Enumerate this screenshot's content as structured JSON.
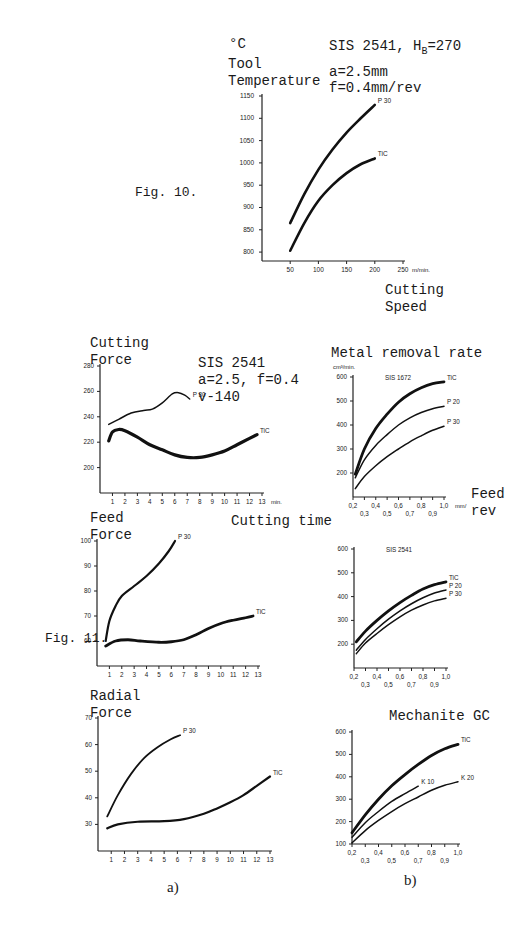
{
  "fig10": {
    "label": "Fig. 10.",
    "y_unit": "°C",
    "y_title_1": "Tool",
    "y_title_2": "Temperature",
    "cond_1": "SIS 2541, H",
    "cond_1_sub": "B",
    "cond_1_tail": "=270",
    "cond_2": "a=2.5mm",
    "cond_3": "f=0.4mm/rev",
    "x_title_1": "Cutting",
    "x_title_2": "Speed",
    "x_unit": "m/min."
  },
  "fig11": {
    "label": "Fig. 11.",
    "cf_title_1": "Cutting",
    "cf_title_2": "Force",
    "cf_cond_1": "SIS 2541",
    "cf_cond_2": "a=2.5, f=0.4",
    "cf_cond_3": "v-140",
    "ff_title_1": "Feed",
    "ff_title_2": "Force",
    "cutting_time": "Cutting time",
    "rf_title_1": "Radial",
    "rf_title_2": "Force",
    "mrr_title": "Metal removal rate",
    "mrr_unit": "cm³/min.",
    "feed_title_1": "Feed",
    "feed_title_2": "rev",
    "mech_title": "Mechanite GC",
    "sub_a": "a)",
    "sub_b": "b)",
    "min_unit": "min.",
    "feed_unit": "mm/"
  },
  "chart_data": [
    {
      "id": "tool-temperature",
      "type": "line",
      "title": "Tool Temperature vs Cutting Speed (SIS 2541, HB=270, a=2.5mm, f=0.4mm/rev)",
      "xlabel": "Cutting Speed (m/min.)",
      "ylabel": "Tool Temperature (°C)",
      "xlim": [
        0,
        250
      ],
      "ylim": [
        780,
        1150
      ],
      "xticks": [
        50,
        100,
        150,
        200,
        250
      ],
      "yticks": [
        800,
        850,
        900,
        950,
        1000,
        1050,
        1100,
        1150
      ],
      "grid": false,
      "series": [
        {
          "name": "P 30",
          "width": 2.6,
          "x": [
            50,
            75,
            100,
            125,
            150,
            175,
            200
          ],
          "y": [
            865,
            930,
            985,
            1030,
            1068,
            1100,
            1130
          ]
        },
        {
          "name": "TiC",
          "width": 2.6,
          "x": [
            50,
            75,
            100,
            125,
            150,
            175,
            200
          ],
          "y": [
            803,
            865,
            915,
            950,
            977,
            997,
            1010
          ]
        }
      ]
    },
    {
      "id": "cutting-force",
      "type": "line",
      "title": "Cutting Force vs Cutting time (SIS 2541, a=2.5, f=0.4, v-140)",
      "xlabel": "Cutting time (min.)",
      "ylabel": "Cutting Force",
      "xlim": [
        0,
        13
      ],
      "ylim": [
        180,
        280
      ],
      "xticks": [
        1,
        2,
        3,
        4,
        5,
        6,
        7,
        8,
        9,
        10,
        11,
        12,
        13
      ],
      "yticks": [
        200,
        220,
        240,
        260,
        280
      ],
      "grid": false,
      "series": [
        {
          "name": "P 30",
          "width": 1.5,
          "x": [
            0.7,
            1.5,
            2.5,
            3.5,
            4.2,
            5,
            5.8,
            6.3,
            6.8,
            7.2
          ],
          "y": [
            234,
            238,
            243,
            245,
            246,
            251,
            258,
            259,
            257,
            254
          ]
        },
        {
          "name": "TiC",
          "width": 3.2,
          "x": [
            0.7,
            1.0,
            1.5,
            2.0,
            3,
            4,
            5,
            6,
            7,
            8,
            9,
            10,
            11,
            12,
            12.6
          ],
          "y": [
            221,
            228,
            230,
            229,
            224,
            218,
            214,
            210,
            208,
            208,
            210,
            213,
            218,
            223,
            226
          ]
        }
      ]
    },
    {
      "id": "feed-force",
      "type": "line",
      "title": "Feed Force vs Cutting time",
      "xlabel": "Cutting time (min.)",
      "ylabel": "Feed Force",
      "xlim": [
        0,
        13
      ],
      "ylim": [
        50,
        100
      ],
      "xticks": [
        1,
        2,
        3,
        4,
        5,
        6,
        7,
        8,
        9,
        10,
        11,
        12,
        13
      ],
      "yticks": [
        60,
        70,
        80,
        90,
        100
      ],
      "grid": false,
      "series": [
        {
          "name": "P 30",
          "width": 2.2,
          "x": [
            0.7,
            1.0,
            1.5,
            2.0,
            3,
            4,
            5,
            5.8,
            6.3
          ],
          "y": [
            60,
            68,
            74,
            78,
            82,
            86,
            91,
            96,
            100
          ]
        },
        {
          "name": "TiC",
          "width": 2.8,
          "x": [
            0.7,
            1.5,
            2.5,
            3.5,
            5,
            6,
            7,
            8,
            9,
            10,
            11,
            12,
            12.6
          ],
          "y": [
            58,
            60,
            60.5,
            60,
            59.5,
            59.7,
            60.5,
            62.5,
            65,
            67,
            68.3,
            69.3,
            70
          ]
        }
      ]
    },
    {
      "id": "radial-force",
      "type": "line",
      "title": "Radial Force vs Cutting time",
      "xlabel": "Cutting time (min.)",
      "ylabel": "Radial Force",
      "xlim": [
        0,
        13
      ],
      "ylim": [
        20,
        70
      ],
      "xticks": [
        1,
        2,
        3,
        4,
        5,
        6,
        7,
        8,
        9,
        10,
        11,
        12,
        13
      ],
      "yticks": [
        30,
        40,
        50,
        60,
        70
      ],
      "grid": false,
      "series": [
        {
          "name": "P 30",
          "width": 1.8,
          "x": [
            0.7,
            1.5,
            2.5,
            3.5,
            4.5,
            5.5,
            6.2
          ],
          "y": [
            33,
            41,
            49,
            55,
            59,
            62,
            63.5
          ]
        },
        {
          "name": "TiC",
          "width": 2.2,
          "x": [
            0.7,
            1.5,
            3,
            5,
            6.5,
            8,
            9,
            10,
            11,
            12,
            13
          ],
          "y": [
            28.5,
            30,
            31,
            31.2,
            32,
            34,
            36,
            38.3,
            41,
            44.5,
            48
          ]
        }
      ]
    },
    {
      "id": "mrr-sis1672",
      "type": "line",
      "title": "Metal removal rate — SIS 1672",
      "xlabel": "Feed (mm/rev)",
      "ylabel": "cm³/min.",
      "xlim": [
        0.2,
        1.0
      ],
      "ylim": [
        100,
        600
      ],
      "xticks": [
        0.2,
        0.3,
        0.4,
        0.5,
        0.6,
        0.7,
        0.8,
        0.9,
        1.0
      ],
      "yticks": [
        200,
        300,
        400,
        500,
        600
      ],
      "grid": false,
      "series": [
        {
          "name": "TiC",
          "width": 2.8,
          "x": [
            0.22,
            0.3,
            0.4,
            0.5,
            0.6,
            0.7,
            0.8,
            0.9,
            1.0
          ],
          "y": [
            195,
            300,
            385,
            445,
            495,
            530,
            555,
            572,
            580
          ]
        },
        {
          "name": "P 20",
          "width": 1.5,
          "x": [
            0.22,
            0.3,
            0.4,
            0.5,
            0.6,
            0.7,
            0.8,
            0.9,
            1.0
          ],
          "y": [
            180,
            255,
            315,
            360,
            400,
            430,
            452,
            468,
            478
          ]
        },
        {
          "name": "P 30",
          "width": 1.5,
          "x": [
            0.22,
            0.3,
            0.4,
            0.5,
            0.6,
            0.7,
            0.8,
            0.9,
            1.0
          ],
          "y": [
            135,
            185,
            230,
            268,
            300,
            330,
            355,
            378,
            395
          ]
        }
      ]
    },
    {
      "id": "mrr-sis2541",
      "type": "line",
      "title": "Metal removal rate — SIS 2541",
      "xlabel": "Feed (mm/rev)",
      "ylabel": "cm³/min.",
      "xlim": [
        0.2,
        1.0
      ],
      "ylim": [
        100,
        600
      ],
      "xticks": [
        0.2,
        0.3,
        0.4,
        0.5,
        0.6,
        0.7,
        0.8,
        0.9,
        1.0
      ],
      "yticks": [
        200,
        300,
        400,
        500,
        600
      ],
      "grid": false,
      "series": [
        {
          "name": "TiC",
          "width": 2.8,
          "x": [
            0.22,
            0.3,
            0.4,
            0.5,
            0.6,
            0.7,
            0.8,
            0.9,
            1.0
          ],
          "y": [
            210,
            255,
            300,
            340,
            375,
            405,
            432,
            450,
            462
          ]
        },
        {
          "name": "P 20",
          "width": 1.5,
          "x": [
            0.22,
            0.3,
            0.4,
            0.5,
            0.6,
            0.7,
            0.8,
            0.9,
            1.0
          ],
          "y": [
            175,
            220,
            265,
            305,
            340,
            370,
            395,
            415,
            428
          ]
        },
        {
          "name": "P 30",
          "width": 1.5,
          "x": [
            0.22,
            0.3,
            0.4,
            0.5,
            0.6,
            0.7,
            0.8,
            0.9,
            1.0
          ],
          "y": [
            160,
            205,
            245,
            282,
            315,
            343,
            365,
            382,
            393
          ]
        }
      ]
    },
    {
      "id": "mrr-mechanite",
      "type": "line",
      "title": "Metal removal rate — Mechanite GC",
      "xlabel": "Feed (mm/rev)",
      "ylabel": "cm³/min.",
      "xlim": [
        0.2,
        1.0
      ],
      "ylim": [
        100,
        600
      ],
      "xticks": [
        0.2,
        0.3,
        0.4,
        0.5,
        0.6,
        0.7,
        0.8,
        0.9,
        1.0
      ],
      "yticks": [
        100,
        200,
        300,
        400,
        500,
        600
      ],
      "grid": false,
      "series": [
        {
          "name": "TiC",
          "width": 2.8,
          "x": [
            0.2,
            0.3,
            0.4,
            0.5,
            0.6,
            0.7,
            0.8,
            0.9,
            1.0
          ],
          "y": [
            150,
            230,
            300,
            360,
            410,
            455,
            495,
            525,
            545
          ]
        },
        {
          "name": "K 10",
          "width": 1.5,
          "x": [
            0.2,
            0.3,
            0.4,
            0.5,
            0.6,
            0.7
          ],
          "y": [
            130,
            195,
            245,
            290,
            325,
            358
          ]
        },
        {
          "name": "K 20",
          "width": 1.5,
          "x": [
            0.2,
            0.3,
            0.4,
            0.5,
            0.6,
            0.7,
            0.8,
            0.9,
            1.0
          ],
          "y": [
            105,
            160,
            205,
            245,
            280,
            310,
            340,
            362,
            378
          ]
        }
      ]
    }
  ]
}
